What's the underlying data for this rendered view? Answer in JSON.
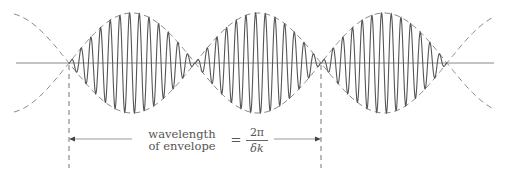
{
  "diagram": {
    "label_line1": "wavelength",
    "label_line2": "of envelope",
    "equals": "=",
    "fraction_numerator": "2π",
    "fraction_denominator": "δk",
    "colors": {
      "carrier": "#555555",
      "envelope": "#8a8a8a",
      "axis": "#888888",
      "text": "#555555"
    },
    "geometry": {
      "axis_y": 63,
      "axis_x_start": 16,
      "axis_x_end": 494,
      "amplitude": 50,
      "nodes_x": [
        69,
        195,
        321,
        447
      ],
      "carrier_cycles_per_lobe": 13,
      "marker_x": [
        69,
        321
      ],
      "arrow_y": 139
    }
  }
}
